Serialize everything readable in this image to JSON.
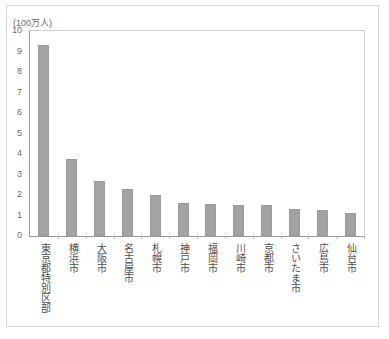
{
  "chart_data": {
    "type": "bar",
    "title": "",
    "subtitle": "",
    "unit_label": "(100万人)",
    "xlabel": "",
    "ylabel": "",
    "ylim": [
      0,
      10
    ],
    "y_ticks": [
      10,
      9,
      8,
      7,
      6,
      5,
      4,
      3,
      2,
      1,
      0
    ],
    "grid": false,
    "legend": null,
    "bar_color": "#a3a3a3",
    "categories": [
      "東京都特別区部",
      "横浜市",
      "大阪市",
      "名古屋市",
      "札幌市",
      "神戸市",
      "福岡市",
      "川崎市",
      "京都市",
      "さいたま市",
      "広島市",
      "仙台市"
    ],
    "values": [
      9.3,
      3.75,
      2.7,
      2.3,
      2.0,
      1.6,
      1.57,
      1.52,
      1.5,
      1.32,
      1.25,
      1.12
    ]
  }
}
